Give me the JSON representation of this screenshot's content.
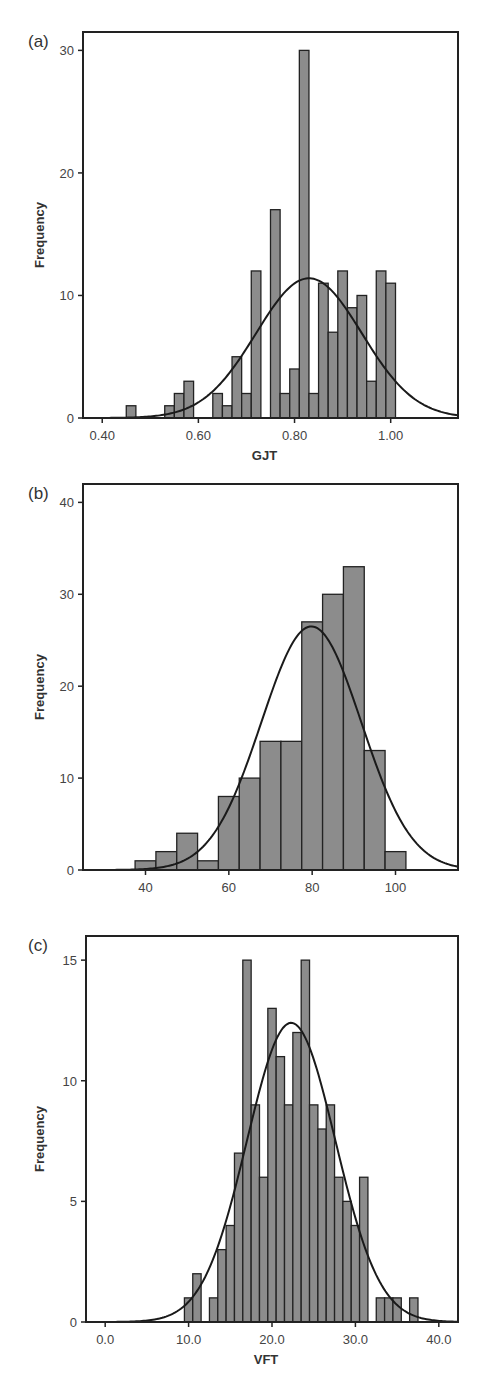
{
  "colors": {
    "bar_fill": "#8c8c8c",
    "bar_stroke": "#222222",
    "curve": "#1a1a1a",
    "frame": "#222222"
  },
  "chart_data": [
    {
      "id": "a",
      "type": "bar",
      "panel_label": "(a)",
      "title": "",
      "xlabel": "GJT",
      "ylabel": "Frequency",
      "xlim": [
        0.36,
        1.14
      ],
      "ylim": [
        0,
        31.5
      ],
      "xticks": [
        0.4,
        0.6,
        0.8,
        1.0
      ],
      "xtick_labels": [
        "0.40",
        "0.60",
        "0.80",
        "1.00"
      ],
      "yticks": [
        0,
        10,
        20,
        30
      ],
      "ytick_labels": [
        "0",
        "10",
        "20",
        "30"
      ],
      "bin_width": 0.02,
      "categories": [
        0.46,
        0.54,
        0.56,
        0.58,
        0.64,
        0.66,
        0.68,
        0.7,
        0.72,
        0.76,
        0.78,
        0.8,
        0.82,
        0.84,
        0.86,
        0.88,
        0.9,
        0.92,
        0.94,
        0.96,
        0.98,
        1.0
      ],
      "values": [
        1,
        1,
        2,
        3,
        2,
        1,
        5,
        2,
        12,
        17,
        2,
        4,
        30,
        2,
        11,
        7,
        12,
        9,
        10,
        3,
        12,
        11
      ],
      "normal_curve": {
        "mean": 0.83,
        "peak": 11.4,
        "sd": 0.11
      },
      "grid": false,
      "legend": null
    },
    {
      "id": "b",
      "type": "bar",
      "panel_label": "(b)",
      "title": "",
      "xlabel": "C-Test",
      "ylabel": "Frequency",
      "xlim": [
        25,
        115
      ],
      "ylim": [
        0,
        42
      ],
      "xticks": [
        40,
        60,
        80,
        100
      ],
      "xtick_labels": [
        "40",
        "60",
        "80",
        "100"
      ],
      "yticks": [
        0,
        10,
        20,
        30,
        40
      ],
      "ytick_labels": [
        "0",
        "10",
        "20",
        "30",
        "40"
      ],
      "bin_width": 5,
      "categories": [
        40,
        45,
        50,
        55,
        60,
        65,
        70,
        75,
        80,
        85,
        90,
        95,
        100
      ],
      "values": [
        1,
        2,
        4,
        1,
        8,
        10,
        14,
        14,
        27,
        30,
        33,
        13,
        2
      ],
      "normal_curve": {
        "mean": 79.8,
        "peak": 26.5,
        "sd": 12.0
      },
      "grid": false,
      "legend": null
    },
    {
      "id": "c",
      "type": "bar",
      "panel_label": "(c)",
      "title": "",
      "xlabel": "VFT",
      "ylabel": "Frequency",
      "xlim": [
        -2.3,
        42.3
      ],
      "ylim": [
        0,
        16
      ],
      "xticks": [
        0,
        10,
        20,
        30,
        40
      ],
      "xtick_labels": [
        "0.0",
        "10.0",
        "20.0",
        "30.0",
        "40.0"
      ],
      "yticks": [
        0,
        5,
        10,
        15
      ],
      "ytick_labels": [
        "0",
        "5",
        "10",
        "15"
      ],
      "bin_width": 1,
      "categories": [
        10,
        11,
        13,
        14,
        15,
        16,
        17,
        18,
        19,
        20,
        21,
        22,
        23,
        24,
        25,
        26,
        27,
        28,
        29,
        30,
        31,
        33,
        34,
        35,
        37
      ],
      "values": [
        1,
        2,
        1,
        3,
        4,
        7,
        15,
        9,
        6,
        13,
        11,
        9,
        12,
        15,
        9,
        8,
        9,
        6,
        5,
        4,
        6,
        1,
        1,
        1,
        1
      ],
      "normal_curve": {
        "mean": 22.3,
        "peak": 12.4,
        "sd": 5.3
      },
      "grid": false,
      "legend": null
    }
  ]
}
